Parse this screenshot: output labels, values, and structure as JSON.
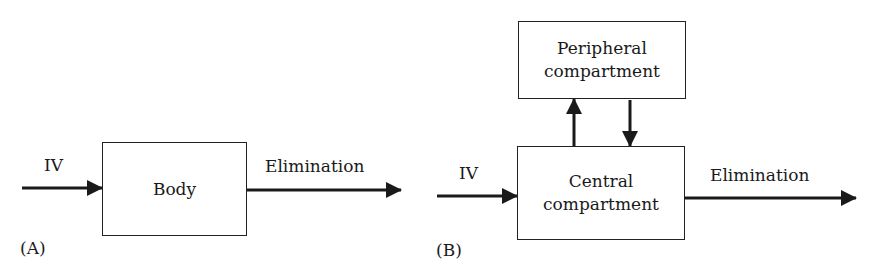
{
  "panel_a": {
    "label": "(A)",
    "box": "Body",
    "input_label": "IV",
    "output_label": "Elimination"
  },
  "panel_b": {
    "label": "(B)",
    "peripheral_box": "Peripheral compartment",
    "central_box": "Central compartment",
    "peripheral_line1": "Peripheral",
    "peripheral_line2": "compartment",
    "central_line1": "Central",
    "central_line2": "compartment",
    "input_label": "IV",
    "output_label": "Elimination"
  }
}
